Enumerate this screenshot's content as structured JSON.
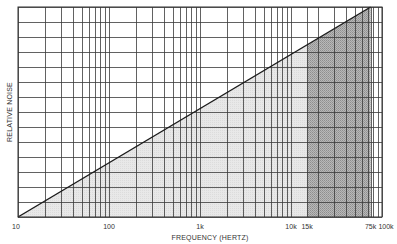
{
  "chart_data": {
    "type": "line",
    "title": "",
    "xlabel": "FREQUENCY (HERTZ)",
    "ylabel": "RELATIVE NOISE",
    "x_scale": "log",
    "xlim": [
      10,
      100000
    ],
    "ylim": [
      0,
      14
    ],
    "grid": true,
    "legend": null,
    "x_tick_labels": [
      {
        "value": 10,
        "label": "10"
      },
      {
        "value": 100,
        "label": "100"
      },
      {
        "value": 1000,
        "label": "1k"
      },
      {
        "value": 10000,
        "label": "10k"
      },
      {
        "value": 15000,
        "label": "15k"
      },
      {
        "value": 75000,
        "label": "75k"
      },
      {
        "value": 100000,
        "label": "100k"
      }
    ],
    "y_gridlines": 15,
    "series": [
      {
        "name": "Relative noise",
        "x": [
          10,
          75000
        ],
        "y": [
          0,
          14
        ]
      }
    ],
    "shaded_regions": [
      {
        "name": "audible-band",
        "from": 10,
        "to": 15000,
        "fill": "#e4e4e4",
        "under_line": true
      },
      {
        "name": "supersonic-band",
        "from": 15000,
        "to": 75000,
        "fill": "#a9a9a9",
        "under_line": true
      }
    ],
    "colors": {
      "line": "#1a1a1a",
      "grid": "#3a3a3a",
      "light_fill": "#e4e4e4",
      "dark_fill": "#a9a9a9"
    }
  }
}
